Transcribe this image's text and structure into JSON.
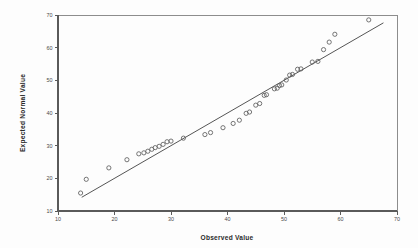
{
  "chart_data": {
    "type": "scatter",
    "title": "",
    "subtitle": "",
    "xlabel": "Observed Value",
    "ylabel": "Expected Normal Value",
    "xlim": [
      10,
      70
    ],
    "ylim": [
      10,
      70
    ],
    "xticks": [
      10,
      20,
      30,
      40,
      50,
      60,
      70
    ],
    "yticks": [
      10,
      20,
      30,
      40,
      50,
      60,
      70
    ],
    "xtick_labels": [
      "10",
      "20",
      "30",
      "40",
      "50",
      "60",
      "70"
    ],
    "ytick_labels": [
      "10",
      "20",
      "30",
      "40",
      "50",
      "60",
      "70"
    ],
    "grid": false,
    "legend": null,
    "legend_position": "none",
    "marker": "open-circle",
    "marker_color": "#5d5d5d",
    "line_color": "#4c4c4c",
    "reference_line": {
      "label": "normal reference line",
      "x_start": 14.2,
      "y_start": 14.2,
      "x_end": 67.6,
      "y_end": 67.6
    },
    "points": [
      {
        "x": 14.0,
        "y": 15.5
      },
      {
        "x": 15.0,
        "y": 19.7
      },
      {
        "x": 19.0,
        "y": 23.2
      },
      {
        "x": 22.2,
        "y": 25.7
      },
      {
        "x": 24.3,
        "y": 27.5
      },
      {
        "x": 25.2,
        "y": 27.8
      },
      {
        "x": 25.9,
        "y": 28.3
      },
      {
        "x": 26.6,
        "y": 28.9
      },
      {
        "x": 27.2,
        "y": 29.4
      },
      {
        "x": 27.9,
        "y": 29.8
      },
      {
        "x": 28.6,
        "y": 30.4
      },
      {
        "x": 29.3,
        "y": 31.2
      },
      {
        "x": 30.0,
        "y": 31.4
      },
      {
        "x": 32.2,
        "y": 32.3
      },
      {
        "x": 36.0,
        "y": 33.4
      },
      {
        "x": 37.0,
        "y": 34.0
      },
      {
        "x": 39.2,
        "y": 35.5
      },
      {
        "x": 41.0,
        "y": 36.8
      },
      {
        "x": 42.1,
        "y": 37.8
      },
      {
        "x": 43.3,
        "y": 39.9
      },
      {
        "x": 43.9,
        "y": 40.3
      },
      {
        "x": 45.0,
        "y": 42.4
      },
      {
        "x": 45.7,
        "y": 42.9
      },
      {
        "x": 46.5,
        "y": 45.4
      },
      {
        "x": 46.9,
        "y": 45.6
      },
      {
        "x": 48.3,
        "y": 47.4
      },
      {
        "x": 48.8,
        "y": 47.6
      },
      {
        "x": 49.2,
        "y": 48.4
      },
      {
        "x": 49.6,
        "y": 48.6
      },
      {
        "x": 50.4,
        "y": 50.1
      },
      {
        "x": 51.0,
        "y": 51.6
      },
      {
        "x": 51.5,
        "y": 51.8
      },
      {
        "x": 52.4,
        "y": 53.4
      },
      {
        "x": 53.0,
        "y": 53.5
      },
      {
        "x": 55.0,
        "y": 55.6
      },
      {
        "x": 56.0,
        "y": 55.8
      },
      {
        "x": 57.0,
        "y": 59.4
      },
      {
        "x": 58.0,
        "y": 61.7
      },
      {
        "x": 59.0,
        "y": 64.1
      },
      {
        "x": 65.0,
        "y": 68.5
      }
    ]
  },
  "axes": {
    "x_title": "Observed Value",
    "y_title": "Expected Normal Value"
  }
}
